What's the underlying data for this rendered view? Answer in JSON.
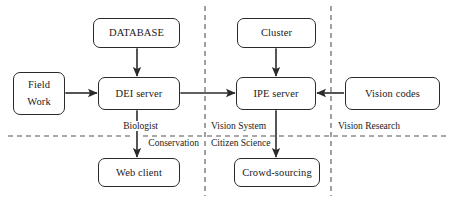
{
  "diagram": {
    "background_color": "#ffffff",
    "stroke_color": "#2b2b2b",
    "divider_color": "#555555",
    "nodes": [
      {
        "id": "database",
        "label": "DATABASE",
        "x": 93,
        "y": 18,
        "w": 87,
        "h": 30
      },
      {
        "id": "cluster",
        "label": "Cluster",
        "x": 237,
        "y": 18,
        "w": 79,
        "h": 30
      },
      {
        "id": "field-work",
        "label": "Field\nWork",
        "line1": "Field",
        "line2": "Work",
        "x": 13,
        "y": 72,
        "w": 52,
        "h": 43
      },
      {
        "id": "dei-server",
        "label": "DEI server",
        "x": 98,
        "y": 77,
        "w": 82,
        "h": 33
      },
      {
        "id": "ipe-server",
        "label": "IPE server",
        "x": 236,
        "y": 77,
        "w": 80,
        "h": 33
      },
      {
        "id": "vision-codes",
        "label": "Vision codes",
        "x": 345,
        "y": 77,
        "w": 95,
        "h": 33
      },
      {
        "id": "web-client",
        "label": "Web client",
        "x": 98,
        "y": 158,
        "w": 82,
        "h": 29
      },
      {
        "id": "crowd-sourcing",
        "label": "Crowd-sourcing",
        "x": 234,
        "y": 158,
        "w": 86,
        "h": 29
      }
    ],
    "connections": [
      {
        "id": "database-dei",
        "from": "database",
        "to": "dei-server",
        "direction": "both",
        "orientation": "vertical"
      },
      {
        "id": "cluster-ipe",
        "from": "cluster",
        "to": "ipe-server",
        "direction": "both",
        "orientation": "vertical"
      },
      {
        "id": "fieldwork-dei",
        "from": "field-work",
        "to": "dei-server",
        "direction": "both",
        "orientation": "horizontal"
      },
      {
        "id": "dei-ipe",
        "from": "dei-server",
        "to": "ipe-server",
        "direction": "both",
        "orientation": "horizontal"
      },
      {
        "id": "visioncodes-ipe",
        "from": "vision-codes",
        "to": "ipe-server",
        "direction": "single",
        "orientation": "horizontal"
      },
      {
        "id": "dei-webclient",
        "from": "dei-server",
        "to": "web-client",
        "direction": "both",
        "orientation": "vertical"
      },
      {
        "id": "ipe-crowdsourcing",
        "from": "ipe-server",
        "to": "crowd-sourcing",
        "direction": "both",
        "orientation": "vertical"
      }
    ],
    "region_labels": [
      {
        "id": "biologist",
        "text": "Biologist",
        "x": 160,
        "y": 122
      },
      {
        "id": "conservation",
        "text": "Conservation",
        "x": 146,
        "y": 139
      },
      {
        "id": "vision-system",
        "text": "Vision System",
        "x": 211,
        "y": 122
      },
      {
        "id": "citizen-science",
        "text": "Citizen Science",
        "x": 211,
        "y": 139
      },
      {
        "id": "vision-research",
        "text": "Vision Research",
        "x": 337,
        "y": 122
      }
    ],
    "dividers": [
      {
        "id": "vertical-divider-left",
        "orientation": "vertical",
        "position": 205
      },
      {
        "id": "vertical-divider-right",
        "orientation": "vertical",
        "position": 331
      },
      {
        "id": "horizontal-divider",
        "orientation": "horizontal",
        "position": 136
      }
    ]
  }
}
